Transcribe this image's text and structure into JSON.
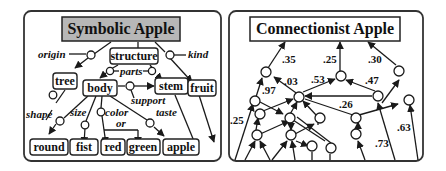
{
  "colors": {
    "ink": "#1a1a1a",
    "symbolic_title_fill": "#b7b7b7",
    "background": "#ffffff"
  },
  "symbolic": {
    "title": "Symbolic Apple",
    "nodes": {
      "structure": "structure",
      "tree": "tree",
      "body": "body",
      "stem": "stem",
      "fruit": "fruit",
      "round": "round",
      "fist": "fist",
      "red": "red",
      "green": "green",
      "apple": "apple"
    },
    "relations": {
      "origin": "origin",
      "kind": "kind",
      "parts": "parts",
      "support": "support",
      "shape": "shape",
      "size": "size",
      "color": "color",
      "or": "or",
      "taste": "taste"
    }
  },
  "connectionist": {
    "title": "Connectionist Apple",
    "weights": {
      "w1": ".35",
      "w2": ".25",
      "w3": ".30",
      "w4": ".03",
      "w5": ".53",
      "w6": ".47",
      "w7": ".97",
      "w8": ".26",
      "w9": ".25",
      "w10": ".63",
      "w11": ".73"
    }
  }
}
